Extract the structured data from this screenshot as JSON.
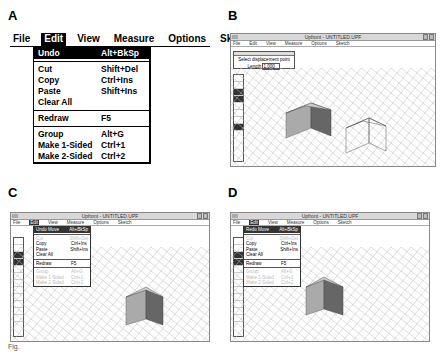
{
  "panels": {
    "a": {
      "letter": "A",
      "menubar": [
        "File",
        "Edit",
        "View",
        "Measure",
        "Options",
        "Sketch"
      ],
      "active_menu": "Edit",
      "edit_menu": [
        {
          "label": "Undo",
          "shortcut": "Alt+BkSp",
          "highlighted": true
        },
        {
          "separator": true
        },
        {
          "label": "Cut",
          "shortcut": "Shift+Del"
        },
        {
          "label": "Copy",
          "shortcut": "Ctrl+Ins"
        },
        {
          "label": "Paste",
          "shortcut": "Shift+Ins"
        },
        {
          "label": "Clear All",
          "shortcut": ""
        },
        {
          "separator": true
        },
        {
          "label": "Redraw",
          "shortcut": "F5"
        },
        {
          "separator": true
        },
        {
          "label": "Group",
          "shortcut": "Alt+G"
        },
        {
          "label": "Make 1-Sided",
          "shortcut": "Ctrl+1"
        },
        {
          "label": "Make 2-Sided",
          "shortcut": "Ctrl+2"
        }
      ]
    },
    "b": {
      "letter": "B",
      "window_title": "Upfront - UNTITLED.UPF",
      "menubar": [
        "File",
        "Edit",
        "View",
        "Measure",
        "Options",
        "Sketch"
      ],
      "prompt_text": "Select displacement point",
      "length_label": "Length",
      "length_value": "1.000"
    },
    "c": {
      "letter": "C",
      "window_title": "Upfront - UNTITLED.UPF",
      "menubar": [
        "File",
        "Edit",
        "View",
        "Measure",
        "Options",
        "Sketch"
      ],
      "edit_menu": [
        {
          "label": "Undo Move",
          "shortcut": "Alt+BkSp",
          "highlighted": true
        },
        {
          "separator": true
        },
        {
          "label": "Cut",
          "shortcut": "Shift+Del",
          "disabled": true
        },
        {
          "label": "Copy",
          "shortcut": "Ctrl+Ins"
        },
        {
          "label": "Paste",
          "shortcut": "Shift+Ins"
        },
        {
          "label": "Clear All",
          "shortcut": ""
        },
        {
          "separator": true
        },
        {
          "label": "Redraw",
          "shortcut": "F5"
        },
        {
          "separator": true
        },
        {
          "label": "Group",
          "shortcut": "Alt+G",
          "disabled": true
        },
        {
          "label": "Make 1-Sided",
          "shortcut": "Ctrl+1",
          "disabled": true
        },
        {
          "label": "Make 2-Sided",
          "shortcut": "Ctrl+2",
          "disabled": true
        }
      ]
    },
    "d": {
      "letter": "D",
      "window_title": "Upfront - UNTITLED.UPF",
      "menubar": [
        "File",
        "Edit",
        "View",
        "Measure",
        "Options",
        "Sketch"
      ],
      "edit_menu": [
        {
          "label": "Redo Move",
          "shortcut": "Alt+BkSp",
          "highlighted": true
        },
        {
          "separator": true
        },
        {
          "label": "Cut",
          "shortcut": "Shift+Del",
          "disabled": true
        },
        {
          "label": "Copy",
          "shortcut": "Ctrl+Ins"
        },
        {
          "label": "Paste",
          "shortcut": "Shift+Ins"
        },
        {
          "label": "Clear All",
          "shortcut": ""
        },
        {
          "separator": true
        },
        {
          "label": "Redraw",
          "shortcut": "F5"
        },
        {
          "separator": true
        },
        {
          "label": "Group",
          "shortcut": "Alt+G",
          "disabled": true
        },
        {
          "label": "Make 1-Sided",
          "shortcut": "Ctrl+1",
          "disabled": true
        },
        {
          "label": "Make 2-Sided",
          "shortcut": "Ctrl+2",
          "disabled": true
        }
      ]
    }
  },
  "caption": "Fig."
}
